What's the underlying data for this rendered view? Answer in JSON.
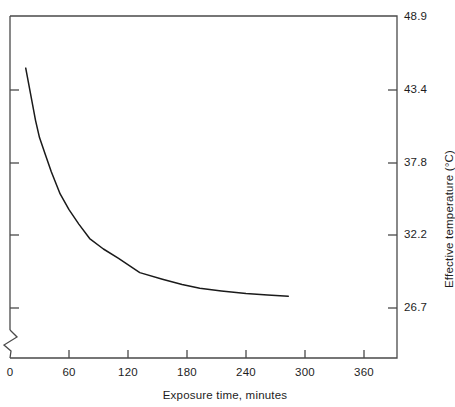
{
  "chart_data": {
    "type": "line",
    "title": "",
    "xlabel": "Exposure time, minutes",
    "ylabel": "Effective temperature (°C)",
    "xlim": [
      0,
      372
    ],
    "ylim": [
      24.6,
      48.9
    ],
    "grid": false,
    "legend": null,
    "axis_break": {
      "axis": "y",
      "style": "zigzag",
      "note": "broken left axis below lowest tick"
    },
    "xticks": [
      0,
      60,
      120,
      180,
      240,
      300,
      360
    ],
    "xtick_labels": [
      "0",
      "60",
      "120",
      "180",
      "240",
      "300",
      "360"
    ],
    "yticks": [
      48.9,
      43.4,
      37.8,
      32.2,
      26.7
    ],
    "ytick_labels": [
      "48.9",
      "43.4",
      "37.8",
      "32.2",
      "26.7"
    ],
    "series": [
      {
        "name": "Effective temperature decay",
        "color": "#1a1a1a",
        "x": [
          16,
          18,
          20,
          23,
          26,
          30,
          36,
          42,
          51,
          60,
          70,
          81,
          95,
          110,
          132,
          155,
          175,
          193,
          215,
          240,
          262,
          283
        ],
        "y": [
          45.0,
          44.2,
          43.4,
          42.2,
          41.0,
          39.7,
          38.4,
          37.1,
          35.4,
          34.2,
          33.1,
          32.0,
          31.2,
          30.5,
          29.4,
          28.9,
          28.5,
          28.2,
          28.0,
          27.8,
          27.7,
          27.6
        ]
      }
    ]
  }
}
